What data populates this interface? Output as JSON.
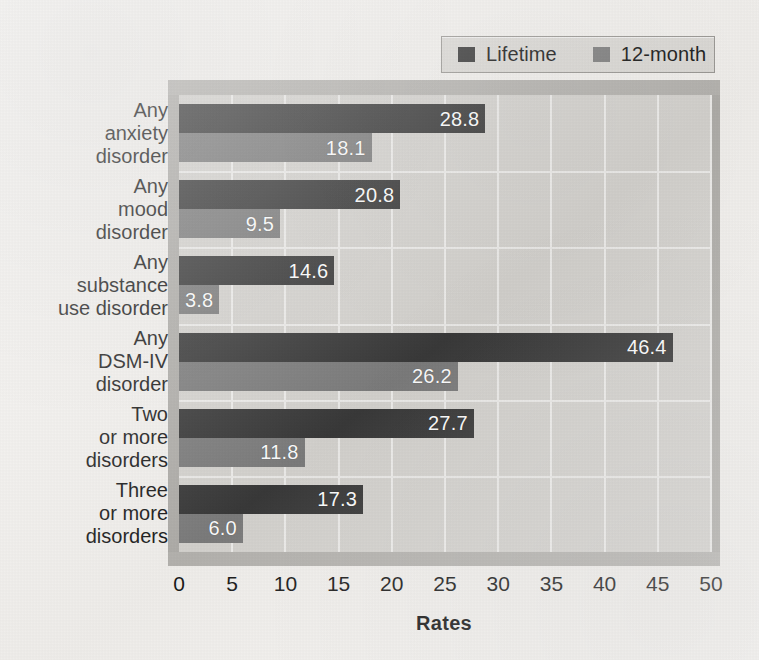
{
  "chart_data": {
    "type": "bar",
    "orientation": "horizontal",
    "title": "",
    "xlabel": "Rates",
    "ylabel": "",
    "xlim": [
      0,
      50
    ],
    "xticks": [
      0,
      5,
      10,
      15,
      20,
      25,
      30,
      35,
      40,
      45,
      50
    ],
    "grid": true,
    "legend_position": "top-right",
    "categories": [
      "Any anxiety disorder",
      "Any mood disorder",
      "Any substance use disorder",
      "Any DSM-IV disorder",
      "Two or more disorders",
      "Three or more disorders"
    ],
    "category_lines": [
      [
        "Any",
        "anxiety",
        "disorder"
      ],
      [
        "Any",
        "mood",
        "disorder"
      ],
      [
        "Any",
        "substance",
        "use disorder"
      ],
      [
        "Any",
        "DSM-IV",
        "disorder"
      ],
      [
        "Two",
        "or more",
        "disorders"
      ],
      [
        "Three",
        "or more",
        "disorders"
      ]
    ],
    "series": [
      {
        "name": "Lifetime",
        "color": "#3a3a3a",
        "values": [
          28.8,
          20.8,
          14.6,
          46.4,
          27.7,
          17.3
        ],
        "labels": [
          "28.8",
          "20.8",
          "14.6",
          "46.4",
          "27.7",
          "17.3"
        ]
      },
      {
        "name": "12-month",
        "color": "#7d7d7d",
        "values": [
          18.1,
          9.5,
          3.8,
          26.2,
          11.8,
          6.0
        ],
        "labels": [
          "18.1",
          "9.5",
          "3.8",
          "26.2",
          "11.8",
          "6.0"
        ]
      }
    ]
  },
  "legend": {
    "entries": [
      {
        "label": "Lifetime",
        "swatch": "#3a3a3a"
      },
      {
        "label": "12-month",
        "swatch": "#7d7d7d"
      }
    ]
  },
  "axis": {
    "x_title": "Rates"
  },
  "colors": {
    "lifetime": "#3a3a3a",
    "twelve_month": "#7d7d7d",
    "plot_background": "#d6d4d0",
    "page_background": "#f3f1ee",
    "gridline": "#efeeec"
  }
}
